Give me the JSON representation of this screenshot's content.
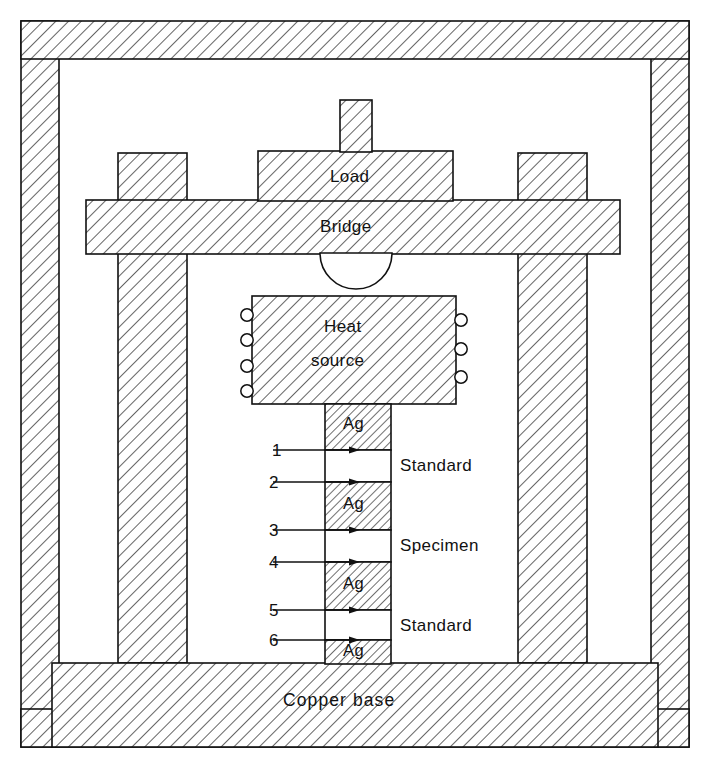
{
  "figure": {
    "domain": "Diagram",
    "background_color": "#ffffff",
    "line_color": "#111111",
    "hatch_color": "#222222"
  },
  "labels": {
    "load": "Load",
    "bridge": "Bridge",
    "heat_source_line1": "Heat",
    "heat_source_line2": "source",
    "copper_base": "Copper base",
    "silver": "Ag"
  },
  "stack": {
    "side_labels": [
      {
        "id": "standard-upper",
        "text": "Standard"
      },
      {
        "id": "specimen",
        "text": "Specimen"
      },
      {
        "id": "standard-lower",
        "text": "Standard"
      }
    ],
    "thermocouple_numbers": [
      "1",
      "2",
      "3",
      "4",
      "5",
      "6"
    ],
    "silver_disc_count": 4,
    "silver_disc_label": "Ag",
    "order_top_to_bottom": [
      "Ag",
      "Standard",
      "Ag",
      "Specimen",
      "Ag",
      "Standard",
      "Ag"
    ]
  },
  "heater": {
    "coil_terminals_left": 4,
    "coil_terminals_right": 3
  },
  "caption": {
    "text": ""
  }
}
